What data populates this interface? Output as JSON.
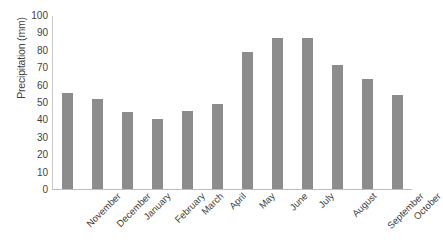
{
  "chart_data": {
    "type": "bar",
    "title": "",
    "subtitle": "",
    "xlabel": "",
    "ylabel": "Precipitation (mm)",
    "categories": [
      "November",
      "December",
      "January",
      "February",
      "March",
      "April",
      "May",
      "June",
      "July",
      "August",
      "September",
      "October"
    ],
    "values": [
      55,
      52,
      44,
      40,
      45,
      49,
      79,
      87,
      87,
      71,
      63,
      54
    ],
    "ylim": [
      0,
      100
    ],
    "ytick_values": [
      0,
      10,
      20,
      30,
      40,
      50,
      60,
      70,
      80,
      90,
      100
    ],
    "ytick_labels": [
      "0",
      "10",
      "20",
      "30",
      "40",
      "50",
      "60",
      "70",
      "80",
      "90",
      "100"
    ],
    "grid": false,
    "legend": false,
    "legend_position": "none",
    "bar_color": "#8c8c8c",
    "axis_color": "#c9c9c9",
    "text_color": "#3f3f3f",
    "xtick_rotation": -45
  }
}
